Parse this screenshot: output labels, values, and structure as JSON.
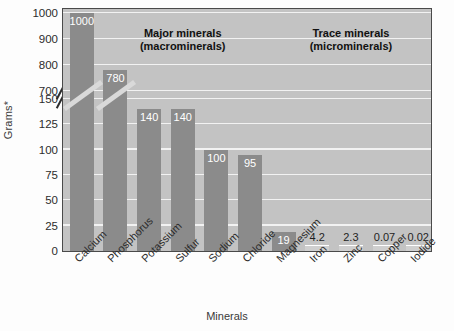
{
  "chart_data": {
    "type": "bar",
    "title": "",
    "xlabel": "Minerals",
    "ylabel": "Grams*",
    "categories": [
      "Calcium",
      "Phosphorus",
      "Potassium",
      "Sulfur",
      "Sodium",
      "Chloride",
      "Magnesium",
      "Iron",
      "Zinc",
      "Copper",
      "Iodide"
    ],
    "values": [
      1000,
      780,
      140,
      140,
      100,
      95,
      19,
      4.2,
      2.3,
      0.07,
      0.02
    ],
    "value_labels": [
      "1000",
      "780",
      "140",
      "140",
      "100",
      "95",
      "19",
      "4.2",
      "2.3",
      "0.07",
      "0.02"
    ],
    "grid": true,
    "legend": "none",
    "axis_break": {
      "present": true,
      "lower_range": [
        0,
        150
      ],
      "upper_range": [
        700,
        1000
      ]
    },
    "yticks": [
      "0",
      "25",
      "50",
      "75",
      "100",
      "125",
      "150",
      "700",
      "800",
      "900",
      "1000"
    ],
    "ylim": [
      0,
      1000
    ],
    "annotations": [
      {
        "line1": "Major minerals",
        "line2": "(macrominerals)"
      },
      {
        "line1": "Trace minerals",
        "line2": "(microminerals)"
      }
    ],
    "colors": {
      "bar": "#8b8b8b",
      "tiny_bar": "#cfcfcf",
      "plot_background": "#c3c3c3",
      "gridline": "#f2f2f2",
      "axis": "#4a4a4a",
      "value_label_light": "#ffffff",
      "value_label_dark": "#1f1f1f"
    }
  }
}
